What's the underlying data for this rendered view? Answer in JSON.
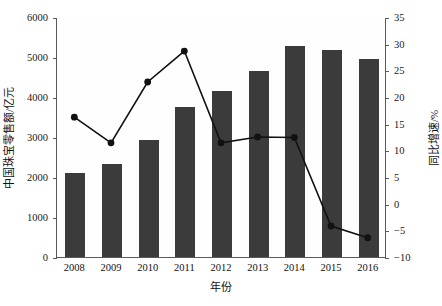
{
  "chart_data": {
    "type": "bar",
    "title": "",
    "subtitle": "",
    "xlabel": "年份",
    "ylabel": "中国珠宝零售额/亿元",
    "y2label": "同比增速/%",
    "categories": [
      "2008",
      "2009",
      "2010",
      "2011",
      "2012",
      "2013",
      "2014",
      "2015",
      "2016"
    ],
    "ylim": [
      0,
      6000
    ],
    "y2lim": [
      -10,
      35
    ],
    "yticks": [
      0,
      1000,
      2000,
      3000,
      4000,
      5000,
      6000
    ],
    "y2ticks": [
      -10,
      -5,
      0,
      5,
      10,
      15,
      20,
      25,
      30,
      35
    ],
    "grid": false,
    "legend": "none",
    "series": [
      {
        "name": "中国珠宝零售额/亿元",
        "type": "bar",
        "axis": "left",
        "color": "#3b3b3b",
        "values": [
          2100,
          2330,
          2930,
          3750,
          4160,
          4660,
          5280,
          5170,
          4960
        ]
      },
      {
        "name": "同比增速/%",
        "type": "line",
        "axis": "right",
        "color": "#111111",
        "values": [
          16.4,
          11.6,
          23.0,
          28.8,
          11.6,
          12.7,
          12.6,
          -4.0,
          -6.2
        ]
      }
    ]
  },
  "axes": {
    "left": {
      "label": "中国珠宝零售额/亿元",
      "ticks": [
        "0",
        "1000",
        "2000",
        "3000",
        "4000",
        "5000",
        "6000"
      ]
    },
    "right": {
      "label": "同比增速/%",
      "ticks": [
        "-10",
        "-5",
        "0",
        "5",
        "10",
        "15",
        "20",
        "25",
        "30",
        "35"
      ]
    },
    "bottom": {
      "label": "年份",
      "ticks": [
        "2008",
        "2009",
        "2010",
        "2011",
        "2012",
        "2013",
        "2014",
        "2015",
        "2016"
      ]
    }
  }
}
